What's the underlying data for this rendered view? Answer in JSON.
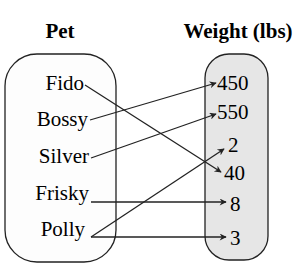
{
  "diagram": {
    "type": "mapping",
    "domain": {
      "header": "Pet",
      "items": [
        "Fido",
        "Bossy",
        "Silver",
        "Frisky",
        "Polly"
      ]
    },
    "range": {
      "header": "Weight (lbs)",
      "items": [
        "450",
        "550",
        "2",
        "40",
        "8",
        "3"
      ]
    },
    "mappings": [
      {
        "from": "Fido",
        "to": "40"
      },
      {
        "from": "Bossy",
        "to": "450"
      },
      {
        "from": "Silver",
        "to": "550"
      },
      {
        "from": "Frisky",
        "to": "8"
      },
      {
        "from": "Polly",
        "to": "2"
      },
      {
        "from": "Polly",
        "to": "3"
      }
    ],
    "colors": {
      "domain_fill": "#fdfdfd",
      "range_fill": "#e6e6e6",
      "stroke": "#222222"
    }
  }
}
